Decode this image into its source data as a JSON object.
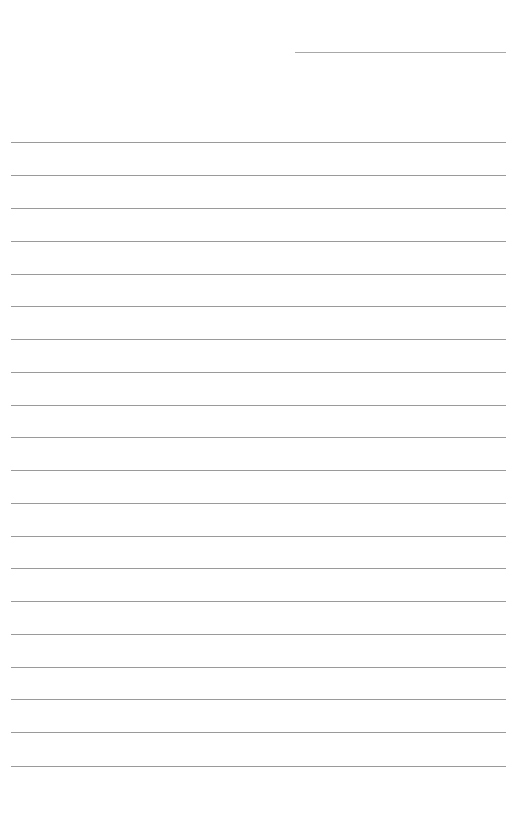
{
  "page": {
    "type": "lined-paper",
    "background": "#ffffff",
    "line_color": "#9a9a9a",
    "header_line": {
      "x": 295,
      "y": 52,
      "width": 211
    },
    "ruled_lines": {
      "count": 20,
      "x": 11,
      "width": 495,
      "y_positions": [
        142,
        175,
        208,
        241,
        274,
        306,
        339,
        372,
        405,
        437,
        470,
        503,
        536,
        568,
        601,
        634,
        667,
        699,
        732,
        766
      ]
    }
  }
}
